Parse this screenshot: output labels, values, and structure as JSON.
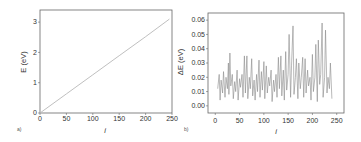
{
  "chart_data": [
    {
      "panel_label": "a)",
      "type": "line",
      "title": "",
      "xlabel": "i",
      "ylabel": "E (eV)",
      "xlim": [
        0,
        250
      ],
      "ylim": [
        0,
        3.4
      ],
      "xticks": [
        "0",
        "50",
        "100",
        "150",
        "200",
        "250"
      ],
      "yticks": [
        "0",
        "1",
        "2",
        "3"
      ],
      "grid": false,
      "legend": null,
      "color": "#b8b8b8",
      "series": [
        {
          "name": "E",
          "x": [
            0,
            50,
            100,
            150,
            200,
            245
          ],
          "values": [
            0.0,
            0.63,
            1.26,
            1.89,
            2.52,
            3.1
          ]
        }
      ]
    },
    {
      "panel_label": "b)",
      "type": "line",
      "title": "",
      "xlabel": "i",
      "ylabel": "ΔE (eV)",
      "xlim": [
        -15,
        265
      ],
      "ylim": [
        -0.005,
        0.065
      ],
      "xticks": [
        "0",
        "50",
        "100",
        "150",
        "200",
        "250"
      ],
      "yticks": [
        "0.00",
        "0.01",
        "0.02",
        "0.03",
        "0.04",
        "0.05",
        "0.06"
      ],
      "grid": false,
      "legend": null,
      "color": "#8a8a8a",
      "series": [
        {
          "name": "ΔE",
          "x": [
            5,
            8,
            10,
            12,
            15,
            17,
            20,
            22,
            25,
            27,
            28,
            30,
            32,
            35,
            37,
            40,
            42,
            45,
            47,
            50,
            52,
            55,
            57,
            60,
            62,
            65,
            67,
            70,
            72,
            75,
            77,
            80,
            82,
            85,
            87,
            90,
            92,
            95,
            97,
            100,
            102,
            105,
            107,
            110,
            112,
            115,
            117,
            120,
            122,
            125,
            127,
            130,
            132,
            135,
            137,
            140,
            142,
            145,
            147,
            150,
            152,
            155,
            157,
            160,
            162,
            165,
            167,
            170,
            172,
            175,
            177,
            180,
            182,
            185,
            187,
            190,
            192,
            195,
            197,
            200,
            202,
            205,
            207,
            210,
            212,
            215,
            217,
            220,
            222,
            225,
            227,
            230,
            232,
            235,
            237,
            240
          ],
          "values": [
            0.012,
            0.022,
            0.004,
            0.018,
            0.009,
            0.024,
            0.006,
            0.02,
            0.012,
            0.03,
            0.008,
            0.037,
            0.014,
            0.022,
            0.005,
            0.017,
            0.01,
            0.025,
            0.004,
            0.019,
            0.013,
            0.022,
            0.006,
            0.035,
            0.009,
            0.035,
            0.005,
            0.02,
            0.012,
            0.033,
            0.007,
            0.018,
            0.004,
            0.022,
            0.01,
            0.032,
            0.006,
            0.024,
            0.011,
            0.031,
            0.005,
            0.028,
            0.009,
            0.02,
            0.014,
            0.025,
            0.003,
            0.018,
            0.01,
            0.022,
            0.006,
            0.034,
            0.012,
            0.035,
            0.007,
            0.025,
            0.004,
            0.038,
            0.011,
            0.022,
            0.05,
            0.006,
            0.028,
            0.056,
            0.008,
            0.02,
            0.033,
            0.005,
            0.03,
            0.012,
            0.02,
            0.034,
            0.006,
            0.033,
            0.009,
            0.025,
            0.014,
            0.02,
            0.004,
            0.036,
            0.01,
            0.02,
            0.043,
            0.003,
            0.046,
            0.015,
            0.022,
            0.058,
            0.006,
            0.02,
            0.053,
            0.009,
            0.02,
            0.012,
            0.03,
            0.005
          ]
        }
      ]
    }
  ],
  "panels": {
    "a": {
      "label": "a)",
      "ylabel": "E (eV)",
      "xlabel": "i"
    },
    "b": {
      "label": "b)",
      "ylabel": "ΔE (eV)",
      "xlabel": "i"
    }
  }
}
